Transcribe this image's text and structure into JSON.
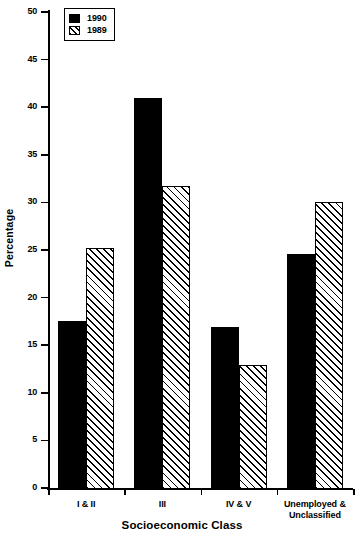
{
  "chart_data": {
    "type": "bar",
    "title": "",
    "xlabel": "Socioeconomic Class",
    "ylabel": "Percentage",
    "categories": [
      "I & II",
      "III",
      "IV & V",
      "Unemployed &\nUnclassified"
    ],
    "category_labels": [
      {
        "line1": "I & II",
        "line2": ""
      },
      {
        "line1": "III",
        "line2": ""
      },
      {
        "line1": "IV & V",
        "line2": ""
      },
      {
        "line1": "Unemployed &",
        "line2": "Unclassified"
      }
    ],
    "series": [
      {
        "name": "1990",
        "fill": "solid",
        "color": "#000000",
        "values": [
          17.6,
          41.1,
          17.0,
          24.7
        ]
      },
      {
        "name": "1989",
        "fill": "hatch",
        "color": "#000000",
        "values": [
          25.3,
          31.8,
          13.0,
          30.2
        ]
      }
    ],
    "ylim": [
      0,
      50
    ],
    "ytick_values": [
      0,
      5,
      10,
      15,
      20,
      25,
      30,
      35,
      40,
      45,
      50
    ],
    "ytick_labels": [
      "0",
      "5",
      "10",
      "15",
      "20",
      "25",
      "30",
      "35",
      "40",
      "45",
      "50"
    ],
    "grid": false,
    "legend_position": "top-left",
    "legend_entries": [
      "1990",
      "1989"
    ],
    "axis_frame": "left-bottom"
  }
}
